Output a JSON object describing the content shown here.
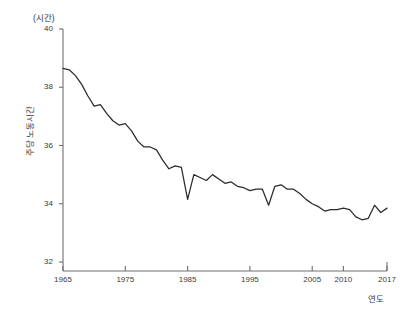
{
  "unit_label": "(시간)",
  "axes": {
    "ylabel": "주당 노동시간",
    "xlabel": "연도",
    "yticks": [
      "32",
      "34",
      "36",
      "38",
      "40"
    ],
    "xticks": [
      "1965",
      "1975",
      "1985",
      "1995",
      "2005",
      "2010",
      "2017"
    ]
  },
  "colors": {
    "line": "#2b2b2b",
    "axis": "#6e6e6e",
    "text": "#3a3a3a",
    "background": "#ffffff"
  },
  "chart_data": {
    "type": "line",
    "title": "",
    "subtitle": "",
    "xlabel": "연도",
    "ylabel": "주당 노동시간",
    "unit": "시간",
    "xlim": [
      1965,
      2017
    ],
    "ylim": [
      32,
      40
    ],
    "yticks": [
      32,
      34,
      36,
      38,
      40
    ],
    "xticks": [
      1965,
      1975,
      1985,
      1995,
      2005,
      2010,
      2017
    ],
    "grid": false,
    "legend": "none",
    "series": [
      {
        "name": "주당 노동시간",
        "x": [
          1965,
          1966,
          1967,
          1968,
          1969,
          1970,
          1971,
          1972,
          1973,
          1974,
          1975,
          1976,
          1977,
          1978,
          1979,
          1980,
          1981,
          1982,
          1983,
          1984,
          1985,
          1986,
          1987,
          1988,
          1989,
          1990,
          1991,
          1992,
          1993,
          1994,
          1995,
          1996,
          1997,
          1998,
          1999,
          2000,
          2001,
          2002,
          2003,
          2004,
          2005,
          2006,
          2007,
          2008,
          2009,
          2010,
          2011,
          2012,
          2013,
          2014,
          2015,
          2016,
          2017
        ],
        "values": [
          38.65,
          38.6,
          38.4,
          38.1,
          37.7,
          37.35,
          37.4,
          37.1,
          36.85,
          36.7,
          36.75,
          36.5,
          36.15,
          35.95,
          35.95,
          35.85,
          35.5,
          35.2,
          35.3,
          35.25,
          34.15,
          35.0,
          34.9,
          34.8,
          35.0,
          34.85,
          34.7,
          34.75,
          34.6,
          34.55,
          34.45,
          34.5,
          34.5,
          33.95,
          34.6,
          34.65,
          34.5,
          34.5,
          34.35,
          34.15,
          34.0,
          33.9,
          33.75,
          33.8,
          33.8,
          33.85,
          33.8,
          33.55,
          33.45,
          33.5,
          33.95,
          33.7,
          33.85
        ]
      }
    ]
  }
}
